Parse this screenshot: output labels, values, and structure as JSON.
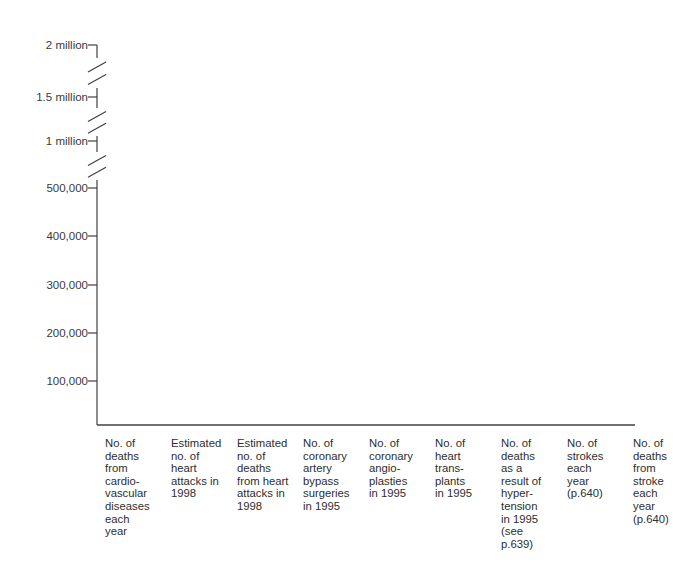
{
  "chart_data": {
    "type": "bar",
    "title": "",
    "subtitle": "",
    "xlabel": "",
    "ylabel": "",
    "grid": false,
    "legend": false,
    "legend_position": "none",
    "note": "Blank worksheet bar chart: axis and category labels drawn, no bars plotted.",
    "axis_break": true,
    "axis_break_count": 3,
    "ylim": [
      0,
      2000000
    ],
    "categories": [
      "No. of\ndeaths\nfrom\ncardio-\nvascular\ndiseases\neach\nyear",
      "Estimated\nno. of\nheart\nattacks in\n1998",
      "Estimated\nno. of\ndeaths\nfrom heart\nattacks in\n1998",
      "No. of\ncoronary\nartery\nbypass\nsurgeries\nin 1995",
      "No. of\ncoronary\nangio-\nplasties\nin 1995",
      "No. of\nheart\ntrans-\nplants\nin 1995",
      "No. of\ndeaths\nas a\nresult of\nhyper-\ntension\nin 1995\n(see\np.639)",
      "No. of\nstrokes\neach\nyear\n(p.640)",
      "No. of\ndeaths\nfrom\nstroke\neach\nyear\n(p.640)"
    ],
    "values": [
      null,
      null,
      null,
      null,
      null,
      null,
      null,
      null,
      null
    ],
    "ytick_labels": [
      "2 million",
      "1.5 million",
      "1 million",
      "500,000",
      "400,000",
      "300,000",
      "200,000",
      "100,000"
    ],
    "ytick_values": [
      2000000,
      1500000,
      1000000,
      500000,
      400000,
      300000,
      200000,
      100000
    ],
    "ytick_y": [
      45,
      97,
      141,
      188,
      236,
      285,
      333,
      381
    ],
    "break_segments": [
      {
        "top": 58,
        "bottom": 88
      },
      {
        "top": 108,
        "bottom": 136
      },
      {
        "top": 152,
        "bottom": 180
      }
    ]
  },
  "axis": {
    "line_color": "#404040",
    "axis_x": 97,
    "axis_top": 45,
    "axis_bottom": 425,
    "baseline_left": 97,
    "baseline_right": 635,
    "tick_length": 9
  },
  "colors": {
    "background": "#ffffff",
    "axis": "#404040",
    "text": "#2e2e2e",
    "tick_text": "#3a3a3a"
  }
}
